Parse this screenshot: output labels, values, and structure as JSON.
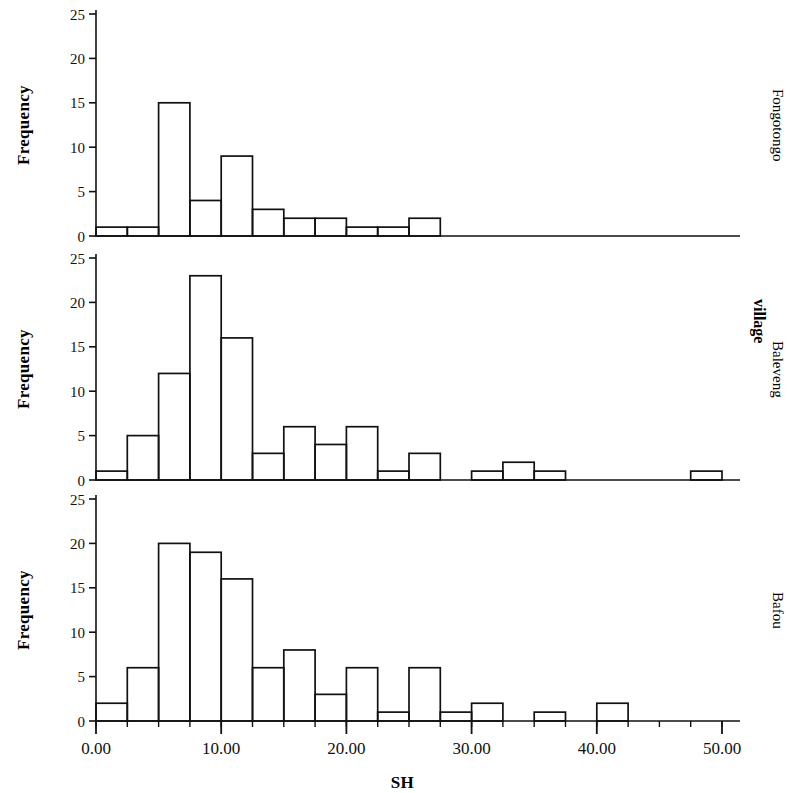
{
  "figure": {
    "y_axis_title": "Frequency",
    "x_axis_title": "SH",
    "group_label": "village"
  },
  "panels": [
    {
      "label": "Fongotongo"
    },
    {
      "label": "Baleveng"
    },
    {
      "label": "Bafou"
    }
  ],
  "axis": {
    "y_ticks": [
      "0",
      "5",
      "10",
      "15",
      "20",
      "25"
    ],
    "x_ticks": [
      "0.00",
      "10.00",
      "20.00",
      "30.00",
      "40.00",
      "50.00"
    ]
  },
  "chart_data": {
    "type": "bar",
    "title": "",
    "subtitle": "",
    "xlabel": "SH",
    "ylabel": "Frequency",
    "group_label": "village",
    "bin_width": 2.5,
    "xlim": [
      0,
      50
    ],
    "ylim": [
      0,
      25
    ],
    "y_ticks": [
      0,
      5,
      10,
      15,
      20,
      25
    ],
    "x_ticks": [
      0,
      10,
      20,
      30,
      40,
      50
    ],
    "grid": false,
    "legend": "none",
    "bin_starts": [
      0,
      2.5,
      5,
      7.5,
      10,
      12.5,
      15,
      17.5,
      20,
      22.5,
      25,
      27.5,
      30,
      32.5,
      35,
      37.5,
      40,
      42.5,
      45,
      47.5
    ],
    "panels": [
      {
        "name": "Fongotongo",
        "values": [
          1,
          1,
          15,
          4,
          9,
          3,
          2,
          2,
          1,
          1,
          2,
          0,
          0,
          0,
          0,
          0,
          0,
          0,
          0,
          0
        ]
      },
      {
        "name": "Baleveng",
        "values": [
          1,
          5,
          12,
          23,
          16,
          3,
          6,
          4,
          6,
          1,
          3,
          0,
          1,
          2,
          1,
          0,
          0,
          0,
          0,
          1
        ]
      },
      {
        "name": "Bafou",
        "values": [
          2,
          6,
          20,
          19,
          16,
          6,
          8,
          3,
          6,
          1,
          6,
          1,
          2,
          0,
          1,
          0,
          2,
          0,
          0,
          0
        ]
      }
    ]
  }
}
